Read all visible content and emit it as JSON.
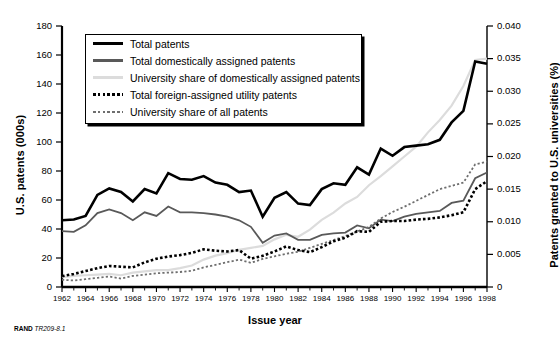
{
  "figure": {
    "footer_brand": "RAND",
    "footer_id": "TR209-8.1"
  },
  "chart_data": {
    "type": "line",
    "title": "",
    "xlabel": "Issue year",
    "ylabel": "U.S. patents (000s)",
    "y2label": "Patents granted to U.S. universities (%)",
    "grid": false,
    "legend_position": "top-left",
    "xlim": [
      1962,
      1998
    ],
    "ylim": [
      0,
      180
    ],
    "y2lim": [
      0,
      0.04
    ],
    "xticks": [
      1962,
      1964,
      1966,
      1968,
      1970,
      1972,
      1974,
      1976,
      1978,
      1980,
      1982,
      1984,
      1986,
      1988,
      1990,
      1992,
      1994,
      1996,
      1998
    ],
    "xtick_labels": [
      "1962",
      "1964",
      "1966",
      "1968",
      "1970",
      "1972",
      "1974",
      "1976",
      "1978",
      "1980",
      "1982",
      "1984",
      "1986",
      "1988",
      "1990",
      "1992",
      "1994",
      "1996",
      "1998"
    ],
    "yticks": [
      0,
      20,
      40,
      60,
      80,
      100,
      120,
      140,
      160,
      180
    ],
    "ytick_labels": [
      "0",
      "20",
      "40",
      "60",
      "80",
      "100",
      "120",
      "140",
      "160",
      "180"
    ],
    "y2ticks": [
      0,
      0.005,
      0.01,
      0.015,
      0.02,
      0.025,
      0.03,
      0.035,
      0.04
    ],
    "y2tick_labels": [
      "0",
      "0.005",
      "0.010",
      "0.015",
      "0.020",
      "0.025",
      "0.030",
      "0.035",
      "0.040"
    ],
    "x": [
      1962,
      1963,
      1964,
      1965,
      1966,
      1967,
      1968,
      1969,
      1970,
      1971,
      1972,
      1973,
      1974,
      1975,
      1976,
      1977,
      1978,
      1979,
      1980,
      1981,
      1982,
      1983,
      1984,
      1985,
      1986,
      1987,
      1988,
      1989,
      1990,
      1991,
      1992,
      1993,
      1994,
      1995,
      1996,
      1997,
      1998
    ],
    "series": [
      {
        "name": "Total patents",
        "axis": "left",
        "color": "#000000",
        "style": "solid",
        "width": 2.6,
        "values": [
          46.0,
          46.5,
          49.0,
          63.5,
          68.0,
          65.5,
          59.0,
          67.5,
          64.5,
          78.5,
          74.5,
          74.0,
          76.5,
          72.0,
          70.5,
          65.5,
          66.5,
          48.5,
          61.5,
          65.5,
          57.5,
          56.5,
          67.5,
          71.5,
          70.5,
          82.5,
          77.5,
          95.5,
          90.5,
          96.5,
          97.5,
          98.5,
          101.5,
          113.5,
          121.5,
          155.5,
          154.0
        ]
      },
      {
        "name": "Total domestically assigned patents",
        "axis": "left",
        "color": "#595959",
        "style": "solid",
        "width": 1.8,
        "values": [
          38.5,
          38.0,
          42.5,
          51.0,
          53.5,
          51.0,
          46.0,
          51.5,
          49.0,
          55.5,
          51.5,
          51.5,
          51.0,
          50.0,
          48.5,
          46.0,
          41.5,
          30.5,
          35.5,
          37.0,
          32.5,
          32.5,
          36.0,
          37.0,
          37.5,
          42.5,
          40.5,
          46.5,
          45.5,
          48.5,
          50.5,
          51.5,
          52.5,
          58.0,
          59.5,
          75.0,
          79.0
        ]
      },
      {
        "name": "University share of domestically assigned patents",
        "axis": "right",
        "color": "#dcdcdc",
        "style": "solid",
        "width": 2.2,
        "values": [
          0.0015,
          0.0017,
          0.0018,
          0.0019,
          0.002,
          0.0018,
          0.0022,
          0.0024,
          0.0026,
          0.0026,
          0.0029,
          0.0033,
          0.0042,
          0.0048,
          0.0052,
          0.0057,
          0.006,
          0.0063,
          0.0073,
          0.008,
          0.0077,
          0.0088,
          0.0103,
          0.0114,
          0.0128,
          0.0138,
          0.0156,
          0.017,
          0.0185,
          0.02,
          0.0215,
          0.0237,
          0.0256,
          0.0278,
          0.0308,
          0.0348,
          0.035
        ]
      },
      {
        "name": "Total foreign-assigned utility patents",
        "axis": "left",
        "color": "#000000",
        "style": "dotted",
        "width": 2.6,
        "values": [
          7.5,
          9.0,
          11.0,
          13.0,
          14.5,
          14.0,
          13.5,
          17.0,
          19.5,
          21.0,
          22.0,
          23.5,
          26.0,
          25.0,
          24.5,
          25.5,
          19.5,
          21.5,
          24.5,
          28.0,
          25.5,
          24.0,
          27.5,
          31.5,
          34.0,
          38.5,
          38.0,
          45.0,
          45.5,
          45.5,
          46.5,
          47.0,
          48.0,
          49.5,
          51.5,
          67.5,
          73.0
        ]
      },
      {
        "name": "University share of all patents",
        "axis": "right",
        "color": "#6e6e6e",
        "style": "dotted",
        "width": 1.8,
        "values": [
          0.0011,
          0.001,
          0.0012,
          0.0014,
          0.0016,
          0.0013,
          0.0017,
          0.0019,
          0.0021,
          0.0022,
          0.0023,
          0.0025,
          0.003,
          0.0034,
          0.0038,
          0.0042,
          0.0037,
          0.0043,
          0.0047,
          0.0051,
          0.0054,
          0.006,
          0.0066,
          0.0072,
          0.0078,
          0.0085,
          0.0092,
          0.0105,
          0.0115,
          0.0123,
          0.0132,
          0.0141,
          0.015,
          0.0155,
          0.016,
          0.0188,
          0.0192
        ]
      }
    ],
    "legend": [
      {
        "label": "Total patents",
        "color": "#000000",
        "style": "solid",
        "width": 2.6
      },
      {
        "label": "Total domestically assigned patents",
        "color": "#595959",
        "style": "solid",
        "width": 2.2
      },
      {
        "label": "University share of domestically assigned patents",
        "color": "#dcdcdc",
        "style": "solid",
        "width": 2.2
      },
      {
        "label": "Total foreign-assigned utility patents",
        "color": "#000000",
        "style": "dotted",
        "width": 2.6
      },
      {
        "label": "University share of all patents",
        "color": "#6e6e6e",
        "style": "dotted",
        "width": 2.0
      }
    ]
  }
}
